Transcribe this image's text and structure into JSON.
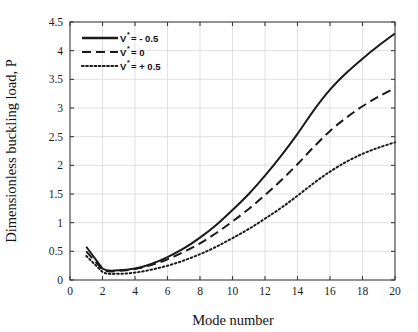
{
  "chart_data": {
    "type": "line",
    "title": "",
    "xlabel": "Mode number",
    "ylabel": "Dimensionless buckling load, P",
    "xlim": [
      0,
      20
    ],
    "ylim": [
      0,
      4.5
    ],
    "xticks": [
      0,
      2,
      4,
      6,
      8,
      10,
      12,
      14,
      16,
      18,
      20
    ],
    "xtick_labels": [
      "0",
      "2",
      "4",
      "6",
      "8",
      "10",
      "12",
      "14",
      "16",
      "18",
      "20"
    ],
    "yticks": [
      0,
      0.5,
      1,
      1.5,
      2,
      2.5,
      3,
      3.5,
      4,
      4.5
    ],
    "ytick_labels": [
      "0",
      "0.5",
      "1",
      "1.5",
      "2",
      "2.5",
      "3",
      "3.5",
      "4",
      "4.5"
    ],
    "grid": true,
    "legend_position": "upper-left",
    "x": [
      1,
      2,
      3,
      4,
      5,
      6,
      7,
      8,
      9,
      10,
      11,
      12,
      13,
      14,
      15,
      16,
      17,
      18,
      19,
      20
    ],
    "series": [
      {
        "name": "V* = - 0.5",
        "style": "solid",
        "values": [
          0.58,
          0.2,
          0.17,
          0.2,
          0.28,
          0.4,
          0.55,
          0.74,
          0.96,
          1.22,
          1.5,
          1.82,
          2.17,
          2.55,
          2.96,
          3.32,
          3.61,
          3.86,
          4.09,
          4.3
        ]
      },
      {
        "name": "V* = 0",
        "style": "dashed",
        "values": [
          0.5,
          0.18,
          0.16,
          0.19,
          0.26,
          0.36,
          0.49,
          0.64,
          0.82,
          1.02,
          1.24,
          1.48,
          1.74,
          2.02,
          2.32,
          2.6,
          2.83,
          3.03,
          3.2,
          3.35
        ]
      },
      {
        "name": "V* = + 0.5",
        "style": "dotted",
        "values": [
          0.42,
          0.14,
          0.11,
          0.13,
          0.18,
          0.25,
          0.34,
          0.45,
          0.58,
          0.73,
          0.89,
          1.07,
          1.26,
          1.47,
          1.69,
          1.89,
          2.06,
          2.2,
          2.31,
          2.4
        ]
      }
    ],
    "legend": [
      {
        "label_main": "V",
        "label_sup": "*",
        "label_rest": " = - 0.5",
        "style": "solid"
      },
      {
        "label_main": "V",
        "label_sup": "*",
        "label_rest": " = 0",
        "style": "dashed"
      },
      {
        "label_main": "V",
        "label_sup": "*",
        "label_rest": " = + 0.5",
        "style": "dotted"
      }
    ],
    "colors": {
      "line": "#1a1a1a",
      "grid": "#d9d9d9",
      "axis": "#3a3a3a",
      "background": "#ffffff"
    }
  }
}
